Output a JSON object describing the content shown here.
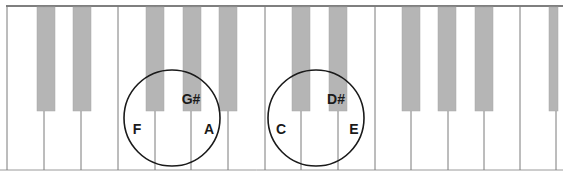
{
  "diagram": {
    "type": "piano-keyboard",
    "keyboard": {
      "top": 6,
      "bottom": 170,
      "left": 7,
      "right": 556,
      "white_key_dividers": [
        44,
        81,
        118,
        155,
        191,
        228,
        265,
        301,
        338,
        375,
        411,
        448,
        484,
        520
      ],
      "black_key_bottom": 111,
      "black_keys": [
        {
          "x": 37,
          "w": 18
        },
        {
          "x": 73,
          "w": 18
        },
        {
          "x": 146,
          "w": 18
        },
        {
          "x": 183,
          "w": 18
        },
        {
          "x": 219,
          "w": 18
        },
        {
          "x": 292,
          "w": 18
        },
        {
          "x": 329,
          "w": 18
        },
        {
          "x": 402,
          "w": 18
        },
        {
          "x": 438,
          "w": 18
        },
        {
          "x": 475,
          "w": 18
        },
        {
          "x": 549,
          "w": 9
        }
      ]
    },
    "groups": [
      {
        "name": "F-G#-A",
        "circle": {
          "cx": 172,
          "cy": 118,
          "r": 48
        },
        "labels": [
          {
            "text": "F",
            "x": 137,
            "y": 134
          },
          {
            "text": "G#",
            "x": 191,
            "y": 104
          },
          {
            "text": "A",
            "x": 209,
            "y": 134
          }
        ]
      },
      {
        "name": "C-D#-E",
        "circle": {
          "cx": 316,
          "cy": 118,
          "r": 48
        },
        "labels": [
          {
            "text": "C",
            "x": 281,
            "y": 134
          },
          {
            "text": "D#",
            "x": 336,
            "y": 104
          },
          {
            "text": "E",
            "x": 354,
            "y": 134
          }
        ]
      }
    ],
    "colors": {
      "white_key": "#ffffff",
      "black_key": "#b5b5b5",
      "outline": "#555555",
      "divider": "#7a7a7a",
      "circle": "#1a1a1a",
      "label": "#1a1a1a"
    }
  }
}
